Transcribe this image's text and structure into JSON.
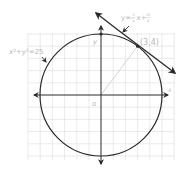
{
  "diagram": {
    "type": "coordinate-plane",
    "circle": {
      "equation": "x²+y²=25",
      "center": [
        0,
        0
      ],
      "radius": 5
    },
    "tangent_line": {
      "equation_label": {
        "prefix": "y=",
        "slope_sign": "-",
        "slope_num": "3",
        "slope_den": "4",
        "mid": "x+",
        "intercept_num": "25",
        "intercept_den": "4"
      },
      "slope": -0.75,
      "intercept": 6.25
    },
    "point": {
      "label": "(3,4)",
      "coords": [
        3,
        4
      ]
    },
    "y_intercept_point": [
      0,
      5
    ],
    "axes": {
      "x_label": "x",
      "y_label": "y",
      "origin_label": "o"
    },
    "grid": {
      "x_range": [
        -6,
        6
      ],
      "y_range": [
        -5,
        5
      ],
      "step": 1
    },
    "colors": {
      "curve": "#2a2a2a",
      "axis": "#2a2a2a",
      "grid": "#d8d8d8",
      "label": "#b8b8b8",
      "radius_line": "#c8c8c8"
    }
  }
}
